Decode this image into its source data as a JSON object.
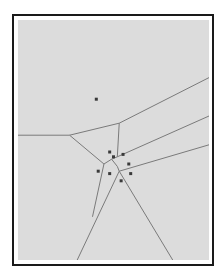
{
  "diagram": {
    "type": "voronoi",
    "title": "",
    "colors": {
      "frame": "#1a1a1a",
      "background": "#dcdcdc",
      "edge": "#7a7a7a",
      "site": "#3a3a3a"
    },
    "sites": [
      {
        "id": "s1",
        "x": 0.41,
        "y": 0.33
      },
      {
        "id": "s2",
        "x": 0.48,
        "y": 0.55
      },
      {
        "id": "s3",
        "x": 0.5,
        "y": 0.57
      },
      {
        "id": "s4",
        "x": 0.55,
        "y": 0.56
      },
      {
        "id": "s5",
        "x": 0.58,
        "y": 0.6
      },
      {
        "id": "s6",
        "x": 0.42,
        "y": 0.63
      },
      {
        "id": "s7",
        "x": 0.48,
        "y": 0.64
      },
      {
        "id": "s8",
        "x": 0.59,
        "y": 0.64
      },
      {
        "id": "s9",
        "x": 0.54,
        "y": 0.67
      }
    ],
    "edges": [
      {
        "id": "e1",
        "from": [
          0.0,
          0.48
        ],
        "to": [
          0.27,
          0.48
        ]
      },
      {
        "id": "e2",
        "from": [
          0.27,
          0.48
        ],
        "to": [
          0.53,
          0.43
        ]
      },
      {
        "id": "e3",
        "from": [
          0.53,
          0.43
        ],
        "to": [
          1.0,
          0.24
        ]
      },
      {
        "id": "e4",
        "from": [
          0.53,
          0.43
        ],
        "to": [
          0.52,
          0.57
        ]
      },
      {
        "id": "e5",
        "from": [
          0.27,
          0.48
        ],
        "to": [
          0.45,
          0.6
        ]
      },
      {
        "id": "e6",
        "from": [
          0.45,
          0.6
        ],
        "to": [
          0.49,
          0.58
        ]
      },
      {
        "id": "e7",
        "from": [
          0.49,
          0.58
        ],
        "to": [
          0.52,
          0.57
        ]
      },
      {
        "id": "e8",
        "from": [
          0.52,
          0.57
        ],
        "to": [
          1.0,
          0.4
        ]
      },
      {
        "id": "e9",
        "from": [
          0.49,
          0.58
        ],
        "to": [
          0.52,
          0.61
        ]
      },
      {
        "id": "e10",
        "from": [
          0.52,
          0.61
        ],
        "to": [
          0.53,
          0.63
        ]
      },
      {
        "id": "e11",
        "from": [
          0.53,
          0.63
        ],
        "to": [
          1.0,
          0.52
        ]
      },
      {
        "id": "e12",
        "from": [
          0.45,
          0.6
        ],
        "to": [
          0.39,
          0.82
        ]
      },
      {
        "id": "e13",
        "from": [
          0.53,
          0.63
        ],
        "to": [
          0.31,
          1.0
        ]
      },
      {
        "id": "e14",
        "from": [
          0.53,
          0.63
        ],
        "to": [
          0.81,
          1.0
        ]
      }
    ]
  }
}
